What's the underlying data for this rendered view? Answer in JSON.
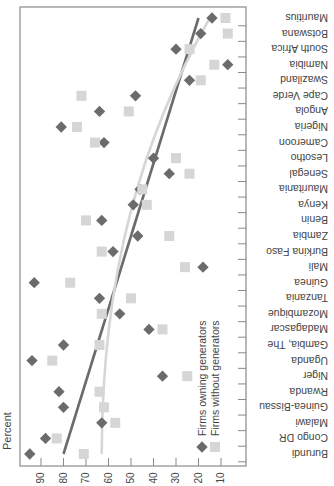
{
  "chart_data": {
    "type": "scatter",
    "orientation": "rotated-180-horizontal",
    "title": "",
    "xlabel": "Percent",
    "ylabel": "",
    "xlim": [
      0,
      100
    ],
    "x_reversed": true,
    "x_ticks": [
      90,
      80,
      70,
      60,
      50,
      40,
      30,
      20,
      10
    ],
    "grid": false,
    "legend_position": "inside-right-bottom",
    "categories": [
      "Burundi",
      "Congo DR",
      "Malawi",
      "Guinea-Bissau",
      "Rwanda",
      "Niger",
      "Uganda",
      "Gambia, The",
      "Madagascar",
      "Mozambique",
      "Tanzania",
      "Guinea",
      "Mali",
      "Burkina Faso",
      "Zambia",
      "Benin",
      "Kenya",
      "Mauritania",
      "Senegal",
      "Lesotho",
      "Cameroon",
      "Nigeria",
      "Angola",
      "Cape Verde",
      "Swaziland",
      "Namibia",
      "South Africa",
      "Botswana",
      "Mauritius"
    ],
    "series": [
      {
        "name": "Firms owning generators",
        "marker": "diamond",
        "color": "#6b6b6b",
        "values": [
          95,
          88,
          63,
          80,
          82,
          36,
          94,
          80,
          42,
          55,
          64,
          93,
          18,
          58,
          47,
          63,
          49,
          46,
          33,
          40,
          62,
          81,
          64,
          48,
          24,
          7,
          30,
          19,
          14
        ],
        "trend": {
          "start": 80,
          "end": 20
        }
      },
      {
        "name": "Firms without generators",
        "marker": "square",
        "color": "#d6d6d6",
        "values": [
          71,
          83,
          57,
          62,
          64,
          25,
          85,
          64,
          36,
          63,
          50,
          77,
          26,
          63,
          33,
          70,
          43,
          45,
          24,
          30,
          66,
          74,
          51,
          72,
          19,
          13,
          24,
          7,
          8
        ],
        "trend": {
          "start": 63,
          "end": 15
        }
      }
    ]
  }
}
